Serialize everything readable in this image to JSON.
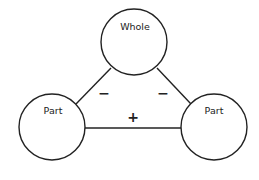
{
  "diagram": {
    "type": "part-whole-model",
    "nodes": [
      {
        "id": "whole",
        "label": "Whole",
        "cx": 134,
        "cy": 42,
        "r": 33
      },
      {
        "id": "part-left",
        "label": "Part",
        "cx": 52,
        "cy": 127,
        "r": 33
      },
      {
        "id": "part-right",
        "label": "Part",
        "cx": 214,
        "cy": 127,
        "r": 33
      }
    ],
    "edges": [
      {
        "from": "whole",
        "to": "part-left",
        "operator": "−"
      },
      {
        "from": "whole",
        "to": "part-right",
        "operator": "−"
      },
      {
        "from": "part-left",
        "to": "part-right",
        "operator": "+"
      }
    ],
    "colors": {
      "stroke": "#222222",
      "background": "#ffffff"
    }
  }
}
